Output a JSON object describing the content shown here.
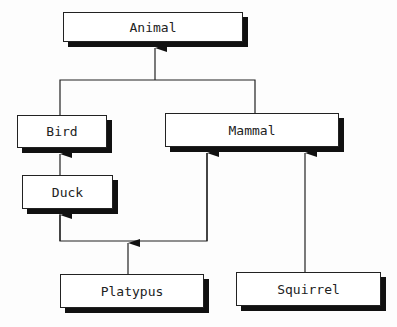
{
  "diagram": {
    "type": "class-hierarchy",
    "nodes": [
      {
        "id": "animal",
        "label": "Animal",
        "x": 63,
        "y": 12,
        "w": 180,
        "h": 30
      },
      {
        "id": "bird",
        "label": "Bird",
        "x": 17,
        "y": 115,
        "w": 90,
        "h": 33
      },
      {
        "id": "mammal",
        "label": "Mammal",
        "x": 165,
        "y": 113,
        "w": 174,
        "h": 34
      },
      {
        "id": "duck",
        "label": "Duck",
        "x": 22,
        "y": 175,
        "w": 91,
        "h": 34
      },
      {
        "id": "platypus",
        "label": "Platypus",
        "x": 60,
        "y": 274,
        "w": 144,
        "h": 34
      },
      {
        "id": "squirrel",
        "label": "Squirrel",
        "x": 236,
        "y": 272,
        "w": 145,
        "h": 34
      }
    ],
    "edges": [
      {
        "from": "bird",
        "to": "animal"
      },
      {
        "from": "mammal",
        "to": "animal"
      },
      {
        "from": "duck",
        "to": "bird"
      },
      {
        "from": "platypus",
        "to": "duck"
      },
      {
        "from": "platypus",
        "to": "mammal"
      },
      {
        "from": "squirrel",
        "to": "mammal"
      }
    ]
  }
}
